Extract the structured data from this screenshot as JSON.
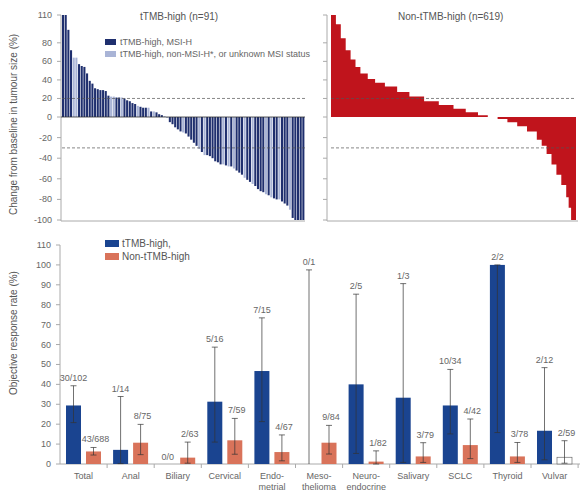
{
  "chart_data": [
    {
      "type": "bar",
      "subtype": "waterfall",
      "title": "tTMB-high (n=91)",
      "ylabel": "Change from baseline in tumour size (%)",
      "ylim": [
        -100,
        110
      ],
      "yticks": [
        110,
        80,
        60,
        40,
        20,
        0,
        -20,
        -40,
        -60,
        -80,
        -100
      ],
      "reference_lines": [
        20,
        -30
      ],
      "legend": [
        {
          "label": "tTMB-high, MSI-H",
          "color": "#1f2f6e"
        },
        {
          "label": "tTMB-high, non-MSI-H*, or unknown MSI status",
          "color": "#a9b4d6"
        }
      ],
      "series": [
        {
          "name": "tTMB-high",
          "values": [
            110,
            110,
            94,
            72,
            64,
            64,
            57,
            55,
            54,
            47,
            39,
            36,
            31,
            30,
            29,
            29,
            28,
            23,
            22,
            22,
            21,
            21,
            21,
            20,
            18,
            17,
            15,
            14,
            12,
            11,
            10,
            10,
            10,
            6,
            6,
            5,
            3,
            2,
            1,
            -1,
            -5,
            -7,
            -10,
            -12,
            -14,
            -15,
            -16,
            -19,
            -22,
            -25,
            -28,
            -31,
            -34,
            -37,
            -37,
            -38,
            -40,
            -43,
            -44,
            -46,
            -46,
            -47,
            -48,
            -48,
            -50,
            -52,
            -54,
            -56,
            -59,
            -61,
            -63,
            -65,
            -67,
            -70,
            -72,
            -73,
            -75,
            -76,
            -78,
            -79,
            -80,
            -80,
            -82,
            -84,
            -86,
            -90,
            -98,
            -100,
            -100,
            -100,
            -100
          ],
          "msi_h": [
            1,
            1,
            1,
            1,
            0,
            0,
            1,
            1,
            1,
            1,
            1,
            1,
            1,
            1,
            1,
            1,
            1,
            1,
            0,
            0,
            1,
            1,
            0,
            1,
            1,
            1,
            1,
            1,
            0,
            1,
            1,
            1,
            0,
            1,
            0,
            1,
            1,
            1,
            0,
            0,
            1,
            1,
            1,
            1,
            1,
            0,
            1,
            1,
            1,
            1,
            1,
            0,
            1,
            0,
            1,
            1,
            1,
            1,
            1,
            1,
            0,
            1,
            0,
            1,
            0,
            1,
            1,
            1,
            0,
            1,
            1,
            0,
            1,
            1,
            1,
            1,
            0,
            1,
            0,
            1,
            1,
            0,
            1,
            1,
            1,
            0,
            1,
            1,
            1,
            1,
            1
          ]
        }
      ]
    },
    {
      "type": "area",
      "subtype": "waterfall",
      "title": "Non-tTMB-high (n=619)",
      "ylim": [
        -100,
        110
      ],
      "reference_lines": [
        20,
        -30
      ],
      "color": "#c0141c",
      "series": [
        {
          "name": "Non-tTMB-high",
          "x_fraction": [
            0,
            0.02,
            0.04,
            0.06,
            0.08,
            0.1,
            0.12,
            0.15,
            0.18,
            0.22,
            0.27,
            0.32,
            0.38,
            0.44,
            0.5,
            0.55,
            0.6,
            0.64,
            0.68,
            0.72,
            0.76,
            0.8,
            0.84,
            0.86,
            0.88,
            0.9,
            0.92,
            0.94,
            0.96,
            0.97,
            0.98,
            1.0
          ],
          "values": [
            110,
            100,
            85,
            72,
            62,
            54,
            47,
            41,
            37,
            33,
            27,
            22,
            17,
            13,
            9,
            5,
            2,
            0,
            -2,
            -5,
            -9,
            -14,
            -22,
            -28,
            -36,
            -46,
            -56,
            -66,
            -78,
            -88,
            -100,
            -100
          ]
        }
      ]
    },
    {
      "type": "bar",
      "title": "",
      "xlabel": "",
      "ylabel": "Objective response rate (%)",
      "ylim": [
        0,
        110
      ],
      "yticks": [
        0,
        10,
        20,
        30,
        40,
        50,
        60,
        70,
        80,
        90,
        100,
        110
      ],
      "legend": [
        {
          "label": "tTMB-high,",
          "color": "#1a4490"
        },
        {
          "label": "Non-tTMB-high",
          "color": "#d9735a"
        }
      ],
      "categories": [
        "Total",
        "Anal",
        "Biliary",
        "Cervical",
        "Endo-\nmetrial",
        "Meso-\nthelioma",
        "Neuro-\nendocrine",
        "Salivary",
        "SCLC",
        "Thyroid",
        "Vulvar"
      ],
      "series": [
        {
          "name": "tTMB-high",
          "values": [
            29.4,
            7.1,
            null,
            31.3,
            46.7,
            0,
            40.0,
            33.3,
            29.4,
            100,
            16.7
          ],
          "ci_low": [
            20.8,
            0.2,
            null,
            11.0,
            21.3,
            0,
            5.3,
            0.8,
            15.1,
            15.8,
            2.1
          ],
          "ci_high": [
            39.3,
            33.9,
            null,
            58.7,
            73.4,
            97.5,
            85.3,
            90.6,
            47.5,
            100,
            48.4
          ],
          "labels": [
            "30/102",
            "1/14",
            "0/0",
            "5/16",
            "7/15",
            "0/1",
            "2/5",
            "1/3",
            "10/34",
            "2/2",
            "2/12"
          ]
        },
        {
          "name": "Non-tTMB-high",
          "values": [
            6.3,
            10.7,
            3.2,
            11.9,
            6.0,
            10.7,
            1.2,
            3.8,
            9.5,
            3.8,
            3.4
          ],
          "ci_low": [
            4.5,
            4.7,
            0.4,
            4.9,
            1.6,
            5.0,
            0.0,
            0.8,
            2.7,
            0.8,
            0.4
          ],
          "ci_high": [
            8.3,
            19.9,
            11.0,
            22.9,
            14.6,
            19.4,
            6.6,
            10.7,
            22.6,
            10.8,
            11.7
          ],
          "labels": [
            "43/688",
            "8/75",
            "2/63",
            "7/59",
            "4/67",
            "9/84",
            "1/82",
            "3/79",
            "4/42",
            "3/78",
            "2/59"
          ]
        }
      ]
    }
  ]
}
